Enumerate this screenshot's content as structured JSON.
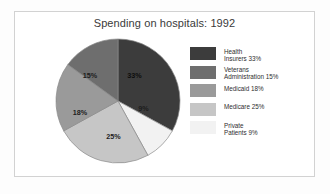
{
  "chart_data": {
    "type": "pie",
    "title": "Spending on hospitals: 1992",
    "xlabel": "",
    "ylabel": "",
    "legend_position": "right",
    "grid": false,
    "start_angle_deg": 0,
    "direction": "clockwise",
    "categories": [
      "Health Insurers",
      "Private Patients",
      "Medicare",
      "Medicaid",
      "Veterans Administration"
    ],
    "values": [
      33,
      9,
      25,
      18,
      15
    ],
    "units": "percent",
    "slices": [
      {
        "name": "Health Insurers",
        "value": 33,
        "label": "33%",
        "color": "#3c3c3c",
        "start_deg": 0,
        "end_deg": 118.8,
        "label_x": 79.5,
        "label_y": 40.0,
        "on_dark": true
      },
      {
        "name": "Private Patients",
        "value": 9,
        "label": "9%",
        "color": "#f2f2f2",
        "start_deg": 118.8,
        "end_deg": 151.2,
        "label_x": 88.5,
        "label_y": 73.0,
        "on_dark": false
      },
      {
        "name": "Medicare",
        "value": 25,
        "label": "25%",
        "color": "#c6c6c6",
        "start_deg": 151.2,
        "end_deg": 241.2,
        "label_x": 58.5,
        "label_y": 101.0,
        "on_dark": false
      },
      {
        "name": "Medicaid",
        "value": 18,
        "label": "18%",
        "color": "#9a9a9a",
        "start_deg": 241.2,
        "end_deg": 306.0,
        "label_x": 25.0,
        "label_y": 76.5,
        "on_dark": false
      },
      {
        "name": "Veterans Administration",
        "value": 15,
        "label": "15%",
        "color": "#6e6e6e",
        "start_deg": 306.0,
        "end_deg": 360.0,
        "label_x": 35.0,
        "label_y": 39.5,
        "on_dark": false
      }
    ],
    "legend": [
      {
        "label": "Health\nInsurers 33%",
        "color": "#3c3c3c"
      },
      {
        "label": "Veterans\nAdministration 15%",
        "color": "#6e6e6e"
      },
      {
        "label": "Medicaid 18%",
        "color": "#9a9a9a"
      },
      {
        "label": "Medicare 25%",
        "color": "#c6c6c6"
      },
      {
        "label": "Private\nPatients 9%",
        "color": "#f2f2f2"
      }
    ]
  },
  "colors": {
    "frame_border": "#d2d2d2",
    "background": "#ffffff",
    "title_text": "#3a3a3a",
    "legend_text": "#2e2e2e",
    "pie_outline": "#8a8a8a"
  }
}
